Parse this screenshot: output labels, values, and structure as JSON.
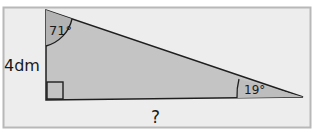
{
  "figure": {
    "type": "right-triangle",
    "colors": {
      "background": "#ffffff",
      "frame_fill": "#ededed",
      "frame_stroke": "#b8b8b8",
      "triangle_fill": "#c4c4c4",
      "angle_fill": "#b3b3b3",
      "stroke": "#1f1f1f"
    },
    "labels": {
      "top_angle": "71°",
      "right_angle_value": "19°",
      "left_side": "4dm",
      "bottom_side": "?"
    }
  }
}
